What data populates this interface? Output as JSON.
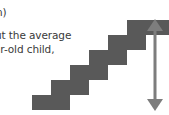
{
  "figure": {
    "background_color": "#ffffff",
    "caption_fragment": {
      "partial_line_0": "n)",
      "partial_line_1": "ut the average",
      "partial_line_2": "ar-old child,",
      "text_color": "#3a3a3a"
    },
    "diagram": {
      "name": "staircase-with-height-arrow",
      "shape_color": "#595959",
      "arrow_color": "#7d7d7d",
      "steps_count": 6,
      "step_width": 19,
      "step_height": 15,
      "origin_x": 32,
      "origin_y": 110,
      "arrow": {
        "type": "double-headed-vertical",
        "x": 155,
        "top_y": 20,
        "bottom_y": 110,
        "head_width": 16,
        "head_height": 11,
        "shaft_width": 3
      }
    }
  }
}
